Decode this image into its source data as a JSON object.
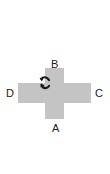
{
  "diagram": {
    "type": "cross-with-rotation",
    "colors": {
      "cross": "#c4c4c4",
      "arrow": "#1a1a1a",
      "label": "#222222",
      "background": "#ffffff"
    },
    "labels": {
      "top": "B",
      "bottom": "A",
      "left": "D",
      "right": "C"
    },
    "icon": "rotation-arrows-icon"
  }
}
